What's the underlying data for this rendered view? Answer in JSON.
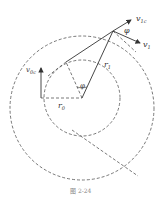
{
  "figure": {
    "caption": "图 2-24",
    "labels": {
      "v1c": {
        "main": "v",
        "sub": "1c"
      },
      "v1": {
        "main": "v",
        "sub": "1"
      },
      "v0c": {
        "main": "v",
        "sub": "0c"
      },
      "phi_top": "φ",
      "phi_center": "φ",
      "r1": {
        "main": "r",
        "sub": "1"
      },
      "r0": {
        "main": "r",
        "sub": "0"
      }
    },
    "colors": {
      "line": "#333333",
      "dash": "#555555"
    }
  }
}
